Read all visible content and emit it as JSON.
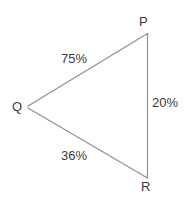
{
  "diagram": {
    "type": "triangle-network",
    "background_color": "#ffffff",
    "line_color": "#8f8f8f",
    "text_color": "#3b3b3b",
    "vertices": [
      {
        "id": "P",
        "label": "P",
        "x": 148,
        "y": 33
      },
      {
        "id": "Q",
        "label": "Q",
        "x": 27,
        "y": 107
      },
      {
        "id": "R",
        "label": "R",
        "x": 148,
        "y": 178
      }
    ],
    "edges": [
      {
        "id": "QP",
        "from": "Q",
        "to": "P",
        "label": "75%",
        "value": 75
      },
      {
        "id": "PR",
        "from": "P",
        "to": "R",
        "label": "20%",
        "value": 20
      },
      {
        "id": "QR",
        "from": "Q",
        "to": "R",
        "label": "36%",
        "value": 36
      }
    ]
  }
}
